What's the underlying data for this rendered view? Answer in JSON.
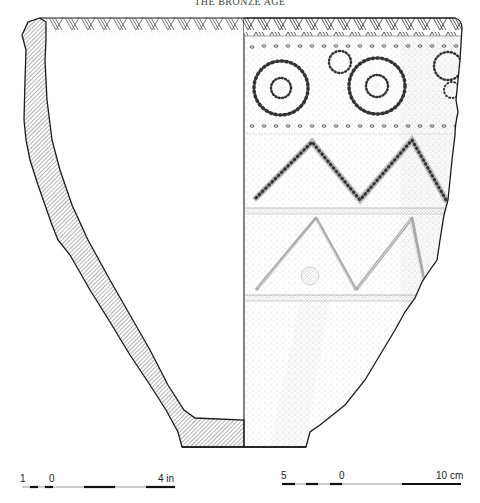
{
  "header": {
    "title": "THE BRONZE AGE"
  },
  "figure": {
    "left_half": "section profile (hatched)",
    "right_half": "exterior elevation with incised and applied decoration",
    "decoration_bands": [
      "rim herringbone / chevron hatching",
      "row of dots",
      "spiral / circle motifs with radiating incisions",
      "row of dots",
      "incised zigzag chevrons",
      "horizontal ridge",
      "applied triangles with central boss",
      "horizontal ridge"
    ]
  },
  "scales": {
    "inches": {
      "left_label": "1",
      "zero_label": "0",
      "right_label": "4 in"
    },
    "cm": {
      "left_label": "5",
      "zero_label": "0",
      "right_label": "10 cm"
    }
  },
  "colors": {
    "ink": "#1a1a1a",
    "hatch": "#555555",
    "stipple": "#9a9a9a",
    "paper": "#ffffff"
  }
}
